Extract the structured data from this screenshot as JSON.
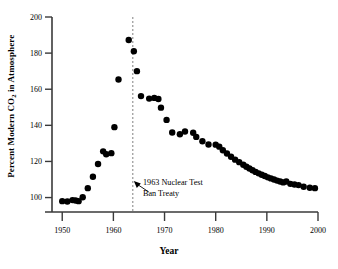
{
  "chart_data": {
    "type": "scatter",
    "title": "",
    "xlabel": "Year",
    "ylabel": "Percent Modern CO2 in Atmosphere",
    "ylabel_parts": {
      "pre": "Percent Modern CO",
      "sub": "2",
      "post": " in Atmosphere"
    },
    "xlim": [
      1948,
      2000
    ],
    "ylim": [
      92,
      200
    ],
    "xticks": [
      1950,
      1960,
      1970,
      1980,
      1990,
      2000
    ],
    "xtick_labels": [
      "1950",
      "1960",
      "1970",
      "1980",
      "1990",
      "2000"
    ],
    "yticks": [
      100,
      120,
      140,
      160,
      180,
      200
    ],
    "ytick_labels": [
      "100",
      "120",
      "140",
      "160",
      "180",
      "200"
    ],
    "grid": false,
    "legend": "none",
    "marker": "filled-circle",
    "marker_color": "#000000",
    "marker_size": 3.2,
    "annotations": [
      {
        "name": "nuclear-test-ban-treaty",
        "line1": "1963 Nuclear Test",
        "line2": "Ban Treaty",
        "vline_year": 1963.8,
        "vline_style": "dashed",
        "vline_color": "#808080",
        "arrow": "up-left"
      }
    ],
    "x": [
      1950.0,
      1951.0,
      1952.0,
      1952.6,
      1953.2,
      1954.0,
      1955.0,
      1956.0,
      1957.0,
      1958.0,
      1958.6,
      1959.6,
      1960.2,
      1961.0,
      1963.0,
      1964.0,
      1964.6,
      1965.4,
      1967.0,
      1968.0,
      1968.8,
      1969.3,
      1970.4,
      1971.5,
      1973.0,
      1974.0,
      1975.6,
      1976.2,
      1977.4,
      1978.6,
      1980.0,
      1980.7,
      1981.4,
      1982.2,
      1983.0,
      1983.8,
      1984.6,
      1985.4,
      1986.0,
      1986.6,
      1987.2,
      1987.8,
      1988.4,
      1989.0,
      1989.6,
      1990.2,
      1990.8,
      1991.4,
      1992.0,
      1992.6,
      1993.2,
      1993.8,
      1994.6,
      1995.4,
      1996.2,
      1997.2,
      1998.4,
      1999.4
    ],
    "y": [
      98.0,
      97.8,
      98.6,
      98.4,
      98.0,
      100.2,
      105.2,
      111.5,
      118.6,
      125.6,
      124.0,
      124.6,
      139.0,
      165.4,
      187.3,
      181.0,
      170.0,
      156.2,
      154.8,
      155.2,
      154.6,
      149.8,
      143.0,
      136.0,
      135.1,
      136.6,
      135.9,
      133.6,
      131.2,
      129.4,
      129.3,
      128.2,
      126.2,
      124.4,
      122.6,
      121.0,
      119.6,
      118.2,
      117.1,
      116.1,
      115.1,
      114.2,
      113.4,
      112.6,
      111.9,
      111.2,
      110.6,
      110.0,
      109.4,
      108.9,
      108.4,
      108.9,
      107.6,
      107.2,
      106.9,
      106.0,
      105.4,
      105.2
    ]
  },
  "axes": {
    "y_axis_name": "y-axis",
    "x_axis_name": "x-axis"
  }
}
